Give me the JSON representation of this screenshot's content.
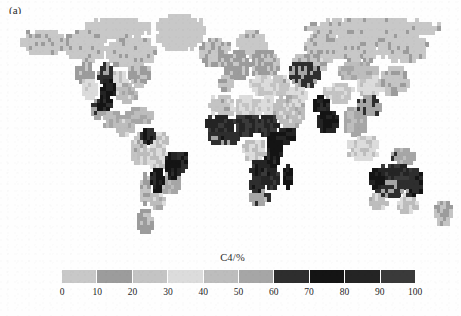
{
  "figure": {
    "panel_label": "(a)",
    "scan_artifact_text": "",
    "background_color": "#fefefe"
  },
  "colorbar": {
    "title": "C4/%",
    "tick_labels": [
      "0",
      "10",
      "20",
      "30",
      "40",
      "50",
      "60",
      "70",
      "80",
      "90",
      "100"
    ],
    "segment_colors": [
      "#c8c8c8",
      "#9c9c9c",
      "#c4c4c4",
      "#dcdcdc",
      "#bdbdbd",
      "#a6a6a6",
      "#2e2e2e",
      "#141414",
      "#242424",
      "#3a3a3a"
    ],
    "segment_ranges": [
      [
        0,
        10
      ],
      [
        10,
        20
      ],
      [
        20,
        30
      ],
      [
        30,
        40
      ],
      [
        40,
        50
      ],
      [
        50,
        60
      ],
      [
        60,
        70
      ],
      [
        70,
        80
      ],
      [
        80,
        90
      ],
      [
        90,
        100
      ]
    ],
    "min": 0,
    "max": 100,
    "units": "%"
  },
  "chart_data": {
    "type": "heatmap",
    "title": "C4/%",
    "subtitle": "",
    "xlabel": "",
    "ylabel": "",
    "legend_position": "bottom",
    "grid": false,
    "colorbar_label": "C4/%",
    "value_range": [
      0,
      100
    ],
    "projection": "equirectangular",
    "lon_range": [
      -180,
      180
    ],
    "lat_range": [
      -58,
      82
    ],
    "cell_size_deg": 2.5,
    "ocean_color": "#fefefe",
    "regions": [
      {
        "name": "alaska-yukon",
        "value": 5,
        "lon": [
          -168,
          -132
        ],
        "lat": [
          58,
          71
        ]
      },
      {
        "name": "canada-boreal-west",
        "value": 4,
        "lon": [
          -132,
          -100
        ],
        "lat": [
          52,
          70
        ]
      },
      {
        "name": "canada-boreal-east",
        "value": 4,
        "lon": [
          -100,
          -62
        ],
        "lat": [
          50,
          68
        ]
      },
      {
        "name": "canada-arctic-islands",
        "value": 3,
        "lon": [
          -120,
          -66
        ],
        "lat": [
          68,
          78
        ]
      },
      {
        "name": "greenland",
        "value": 3,
        "lon": [
          -58,
          -22
        ],
        "lat": [
          60,
          82
        ]
      },
      {
        "name": "us-northwest",
        "value": 14,
        "lon": [
          -125,
          -112
        ],
        "lat": [
          40,
          52
        ]
      },
      {
        "name": "us-southwest-desert",
        "value": 34,
        "lon": [
          -120,
          -108
        ],
        "lat": [
          30,
          40
        ]
      },
      {
        "name": "us-great-plains-north",
        "value": 62,
        "lon": [
          -106,
          -96
        ],
        "lat": [
          40,
          50
        ]
      },
      {
        "name": "us-great-plains-core",
        "value": 78,
        "lon": [
          -104,
          -94
        ],
        "lat": [
          30,
          42
        ]
      },
      {
        "name": "us-texas-mexico-plateau",
        "value": 72,
        "lon": [
          -106,
          -96
        ],
        "lat": [
          22,
          32
        ]
      },
      {
        "name": "us-midwest",
        "value": 38,
        "lon": [
          -96,
          -84
        ],
        "lat": [
          36,
          46
        ]
      },
      {
        "name": "us-southeast",
        "value": 46,
        "lon": [
          -92,
          -76
        ],
        "lat": [
          28,
          38
        ]
      },
      {
        "name": "us-northeast",
        "value": 20,
        "lon": [
          -82,
          -66
        ],
        "lat": [
          38,
          50
        ]
      },
      {
        "name": "mexico-west",
        "value": 58,
        "lon": [
          -112,
          -102
        ],
        "lat": [
          18,
          28
        ]
      },
      {
        "name": "mexico-south",
        "value": 48,
        "lon": [
          -102,
          -88
        ],
        "lat": [
          14,
          22
        ]
      },
      {
        "name": "central-america",
        "value": 44,
        "lon": [
          -92,
          -78
        ],
        "lat": [
          7,
          18
        ]
      },
      {
        "name": "caribbean",
        "value": 50,
        "lon": [
          -84,
          -64
        ],
        "lat": [
          16,
          24
        ]
      },
      {
        "name": "venezuela-llanos",
        "value": 68,
        "lon": [
          -72,
          -60
        ],
        "lat": [
          4,
          12
        ]
      },
      {
        "name": "guyana-shield",
        "value": 42,
        "lon": [
          -62,
          -50
        ],
        "lat": [
          0,
          8
        ]
      },
      {
        "name": "amazon-basin",
        "value": 40,
        "lon": [
          -74,
          -50
        ],
        "lat": [
          -12,
          2
        ]
      },
      {
        "name": "andes-north",
        "value": 24,
        "lon": [
          -80,
          -72
        ],
        "lat": [
          -10,
          8
        ]
      },
      {
        "name": "brazil-cerrado",
        "value": 76,
        "lon": [
          -52,
          -42
        ],
        "lat": [
          -20,
          -4
        ]
      },
      {
        "name": "brazil-caatinga",
        "value": 70,
        "lon": [
          -44,
          -35
        ],
        "lat": [
          -14,
          -4
        ]
      },
      {
        "name": "brazil-southeast",
        "value": 52,
        "lon": [
          -56,
          -40
        ],
        "lat": [
          -26,
          -16
        ]
      },
      {
        "name": "chaco-pantanal",
        "value": 74,
        "lon": [
          -64,
          -54
        ],
        "lat": [
          -26,
          -14
        ]
      },
      {
        "name": "pampas",
        "value": 44,
        "lon": [
          -64,
          -54
        ],
        "lat": [
          -38,
          -28
        ]
      },
      {
        "name": "patagonia",
        "value": 16,
        "lon": [
          -74,
          -64
        ],
        "lat": [
          -52,
          -38
        ]
      },
      {
        "name": "andes-south",
        "value": 20,
        "lon": [
          -72,
          -66
        ],
        "lat": [
          -34,
          -16
        ]
      },
      {
        "name": "iberia",
        "value": 22,
        "lon": [
          -10,
          2
        ],
        "lat": [
          36,
          44
        ]
      },
      {
        "name": "western-europe",
        "value": 12,
        "lon": [
          -6,
          16
        ],
        "lat": [
          44,
          58
        ]
      },
      {
        "name": "scandinavia",
        "value": 5,
        "lon": [
          6,
          30
        ],
        "lat": [
          56,
          70
        ]
      },
      {
        "name": "eastern-europe",
        "value": 16,
        "lon": [
          16,
          40
        ],
        "lat": [
          44,
          58
        ]
      },
      {
        "name": "mediterranean-east",
        "value": 30,
        "lon": [
          16,
          38
        ],
        "lat": [
          34,
          44
        ]
      },
      {
        "name": "sahara-west",
        "value": 26,
        "lon": [
          -16,
          4
        ],
        "lat": [
          20,
          32
        ]
      },
      {
        "name": "sahara-central",
        "value": 30,
        "lon": [
          4,
          26
        ],
        "lat": [
          18,
          32
        ]
      },
      {
        "name": "sahara-east-egypt",
        "value": 34,
        "lon": [
          24,
          36
        ],
        "lat": [
          20,
          32
        ]
      },
      {
        "name": "sahel-west",
        "value": 86,
        "lon": [
          -18,
          4
        ],
        "lat": [
          11,
          19
        ]
      },
      {
        "name": "sahel-central",
        "value": 90,
        "lon": [
          4,
          24
        ],
        "lat": [
          9,
          18
        ]
      },
      {
        "name": "sahel-east-sudan",
        "value": 88,
        "lon": [
          22,
          38
        ],
        "lat": [
          8,
          18
        ]
      },
      {
        "name": "west-africa-guinea",
        "value": 64,
        "lon": [
          -16,
          6
        ],
        "lat": [
          4,
          11
        ]
      },
      {
        "name": "congo-basin",
        "value": 38,
        "lon": [
          10,
          28
        ],
        "lat": [
          -6,
          4
        ]
      },
      {
        "name": "east-africa-highlands",
        "value": 78,
        "lon": [
          30,
          42
        ],
        "lat": [
          -6,
          10
        ]
      },
      {
        "name": "horn-of-africa",
        "value": 82,
        "lon": [
          38,
          52
        ],
        "lat": [
          2,
          12
        ]
      },
      {
        "name": "tanzania-miombo",
        "value": 72,
        "lon": [
          28,
          40
        ],
        "lat": [
          -12,
          -4
        ]
      },
      {
        "name": "zambia-angola",
        "value": 84,
        "lon": [
          16,
          32
        ],
        "lat": [
          -18,
          -8
        ]
      },
      {
        "name": "zimbabwe-mozambique",
        "value": 86,
        "lon": [
          26,
          40
        ],
        "lat": [
          -24,
          -14
        ]
      },
      {
        "name": "kalahari",
        "value": 66,
        "lon": [
          16,
          26
        ],
        "lat": [
          -28,
          -18
        ]
      },
      {
        "name": "south-africa",
        "value": 56,
        "lon": [
          16,
          32
        ],
        "lat": [
          -34,
          -26
        ]
      },
      {
        "name": "madagascar",
        "value": 80,
        "lon": [
          43,
          50
        ],
        "lat": [
          -25,
          -12
        ]
      },
      {
        "name": "arabia",
        "value": 44,
        "lon": [
          36,
          58
        ],
        "lat": [
          14,
          30
        ]
      },
      {
        "name": "anatolia-caucasus",
        "value": 26,
        "lon": [
          28,
          48
        ],
        "lat": [
          34,
          44
        ]
      },
      {
        "name": "iran-plateau",
        "value": 36,
        "lon": [
          46,
          62
        ],
        "lat": [
          26,
          38
        ]
      },
      {
        "name": "central-asia-steppe",
        "value": 62,
        "lon": [
          48,
          72
        ],
        "lat": [
          38,
          50
        ]
      },
      {
        "name": "kazakh-north",
        "value": 24,
        "lon": [
          52,
          80
        ],
        "lat": [
          48,
          56
        ]
      },
      {
        "name": "siberia-west",
        "value": 6,
        "lon": [
          60,
          90
        ],
        "lat": [
          54,
          70
        ]
      },
      {
        "name": "siberia-central",
        "value": 5,
        "lon": [
          86,
          120
        ],
        "lat": [
          52,
          72
        ]
      },
      {
        "name": "siberia-east",
        "value": 5,
        "lon": [
          118,
          160
        ],
        "lat": [
          54,
          72
        ]
      },
      {
        "name": "russia-arctic-coast",
        "value": 4,
        "lon": [
          60,
          170
        ],
        "lat": [
          68,
          78
        ]
      },
      {
        "name": "mongolia-steppe",
        "value": 46,
        "lon": [
          88,
          118
        ],
        "lat": [
          42,
          52
        ]
      },
      {
        "name": "tibet-plateau",
        "value": 28,
        "lon": [
          76,
          100
        ],
        "lat": [
          28,
          38
        ]
      },
      {
        "name": "india-northwest",
        "value": 74,
        "lon": [
          68,
          80
        ],
        "lat": [
          20,
          30
        ]
      },
      {
        "name": "india-deccan",
        "value": 80,
        "lon": [
          72,
          86
        ],
        "lat": [
          10,
          22
        ]
      },
      {
        "name": "indochina",
        "value": 52,
        "lon": [
          94,
          110
        ],
        "lat": [
          8,
          24
        ]
      },
      {
        "name": "china-south",
        "value": 58,
        "lon": [
          104,
          122
        ],
        "lat": [
          20,
          32
        ]
      },
      {
        "name": "china-north",
        "value": 34,
        "lon": [
          104,
          124
        ],
        "lat": [
          32,
          44
        ]
      },
      {
        "name": "manchuria-korea-japan",
        "value": 22,
        "lon": [
          122,
          144
        ],
        "lat": [
          32,
          48
        ]
      },
      {
        "name": "indonesia-sumatra-borneo",
        "value": 36,
        "lon": [
          96,
          120
        ],
        "lat": [
          -6,
          6
        ]
      },
      {
        "name": "new-guinea",
        "value": 54,
        "lon": [
          132,
          150
        ],
        "lat": [
          -10,
          -2
        ]
      },
      {
        "name": "australia-north",
        "value": 88,
        "lon": [
          120,
          146
        ],
        "lat": [
          -20,
          -11
        ]
      },
      {
        "name": "australia-northwest",
        "value": 76,
        "lon": [
          114,
          124
        ],
        "lat": [
          -24,
          -14
        ]
      },
      {
        "name": "australia-interior",
        "value": 60,
        "lon": [
          118,
          142
        ],
        "lat": [
          -30,
          -20
        ]
      },
      {
        "name": "australia-east",
        "value": 66,
        "lon": [
          142,
          154
        ],
        "lat": [
          -30,
          -14
        ]
      },
      {
        "name": "australia-southwest",
        "value": 44,
        "lon": [
          114,
          126
        ],
        "lat": [
          -36,
          -28
        ]
      },
      {
        "name": "australia-southeast",
        "value": 40,
        "lon": [
          136,
          152
        ],
        "lat": [
          -40,
          -30
        ]
      },
      {
        "name": "new-zealand",
        "value": 18,
        "lon": [
          166,
          178
        ],
        "lat": [
          -47,
          -34
        ]
      },
      {
        "name": "iceland-britain",
        "value": 8,
        "lon": [
          -24,
          0
        ],
        "lat": [
          50,
          66
        ]
      }
    ]
  }
}
